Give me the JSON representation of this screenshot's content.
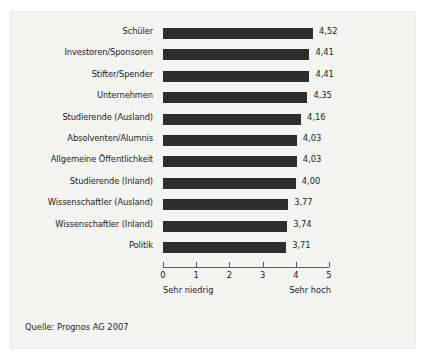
{
  "chart_data": {
    "type": "bar",
    "orientation": "horizontal",
    "title": "",
    "subtitle": "",
    "xlabel": "",
    "ylabel": "",
    "xlim": [
      0,
      5
    ],
    "grid": false,
    "legend": false,
    "bar_color": "#2e2e2e",
    "background_color": "#f4f4f3",
    "axis_color": "#5b5b5b",
    "text_color": "#1c1c1c",
    "categories": [
      "Schüler",
      "Investoren/Sponsoren",
      "Stifter/Spender",
      "Unternehmen",
      "Studierende (Ausland)",
      "Absolventen/Alumnis",
      "Allgemeine Öffentlichkeit",
      "Studierende (Inland)",
      "Wissenschaftler (Ausland)",
      "Wissenschaftler (Inland)",
      "Politik"
    ],
    "values": [
      4.52,
      4.41,
      4.41,
      4.35,
      4.16,
      4.03,
      4.03,
      4.0,
      3.77,
      3.74,
      3.71
    ],
    "value_labels": [
      "4,52",
      "4,41",
      "4,41",
      "4,35",
      "4,16",
      "4,03",
      "4,03",
      "4,00",
      "3,77",
      "3,74",
      "3,71"
    ],
    "xticks": [
      0,
      1,
      2,
      3,
      4,
      5
    ],
    "xtick_labels": [
      "0",
      "1",
      "2",
      "3",
      "4",
      "5"
    ],
    "axis_min_label": "Sehr niedrig",
    "axis_max_label": "Sehr hoch"
  },
  "source": {
    "text": "Quelle: Prognos AG 2007"
  }
}
